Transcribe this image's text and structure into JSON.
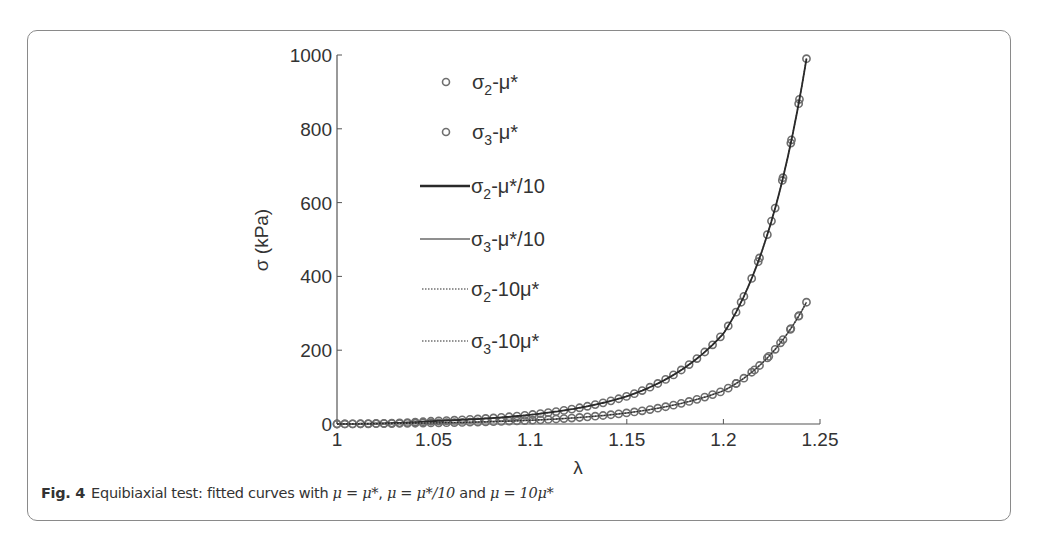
{
  "figure": {
    "label": "Fig. 4",
    "caption_text": "Equibiaxial test: fitted curves with ",
    "caption_math_1": "μ = μ*",
    "caption_sep_1": ", ",
    "caption_math_2": "μ = μ*/10",
    "caption_sep_2": " and ",
    "caption_math_3": "μ = 10μ*"
  },
  "chart_data": {
    "type": "line",
    "title": "",
    "xlabel": "λ",
    "ylabel": "σ (kPa)",
    "xlim": [
      1,
      1.25
    ],
    "ylim": [
      0,
      1000
    ],
    "xticks": [
      "1",
      "1.05",
      "1.1",
      "1.15",
      "1.2",
      "1.25"
    ],
    "yticks": [
      "0",
      "200",
      "400",
      "600",
      "800",
      "1000"
    ],
    "grid": false,
    "legend_position": "upper-left-inside",
    "legend": [
      {
        "main": "σ",
        "sub": "2",
        "rest": "-μ*",
        "style": "marker-circle"
      },
      {
        "main": "σ",
        "sub": "3",
        "rest": "-μ*",
        "style": "marker-circle"
      },
      {
        "main": "σ",
        "sub": "2",
        "rest": "-μ*/10",
        "style": "solid-dark"
      },
      {
        "main": "σ",
        "sub": "3",
        "rest": "-μ*/10",
        "style": "solid-gray"
      },
      {
        "main": "σ",
        "sub": "2",
        "rest": "-10μ*",
        "style": "dotted"
      },
      {
        "main": "σ",
        "sub": "3",
        "rest": "-10μ*",
        "style": "dotted"
      }
    ],
    "x": [
      1.0,
      1.05,
      1.1,
      1.15,
      1.2,
      1.243
    ],
    "series": [
      {
        "name": "σ2-μ*",
        "values": [
          0,
          8,
          25,
          75,
          245,
          990
        ]
      },
      {
        "name": "σ3-μ*",
        "values": [
          0,
          3,
          10,
          30,
          90,
          330
        ]
      },
      {
        "name": "σ2-μ*/10",
        "values": [
          0,
          8,
          25,
          75,
          245,
          990
        ]
      },
      {
        "name": "σ3-μ*/10",
        "values": [
          0,
          3,
          10,
          30,
          90,
          330
        ]
      },
      {
        "name": "σ2-10μ*",
        "values": [
          0,
          8,
          25,
          75,
          245,
          990
        ]
      },
      {
        "name": "σ3-10μ*",
        "values": [
          0,
          3,
          10,
          30,
          90,
          330
        ]
      }
    ],
    "colors": {
      "marker": "#6e6e6e",
      "line_dark": "#2a2a2a",
      "line_gray": "#6a6a6a",
      "axis": "#555555"
    }
  }
}
